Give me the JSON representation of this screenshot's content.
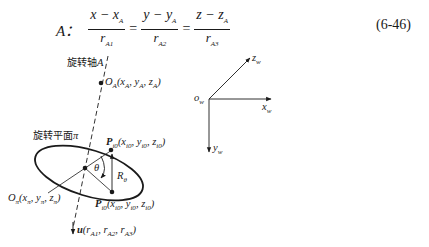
{
  "equation": {
    "label": "A：",
    "fractions": [
      {
        "numerator": "x − x",
        "num_sub": "A",
        "denominator": "r",
        "den_sub": "A1"
      },
      {
        "numerator": "y − y",
        "num_sub": "A",
        "denominator": "r",
        "den_sub": "A2"
      },
      {
        "numerator": "z − z",
        "num_sub": "A",
        "denominator": "r",
        "den_sub": "A3"
      }
    ],
    "operator": "=",
    "number": "(6-46)"
  },
  "diagram": {
    "axis_label": {
      "text": "旋转轴",
      "var": "A"
    },
    "plane_label": {
      "text": "旋转平面",
      "var": "π"
    },
    "point_OA": {
      "name": "O",
      "sub": "A",
      "coords": "(x",
      "args": [
        [
          "A"
        ],
        [
          "A"
        ],
        [
          "A"
        ]
      ]
    },
    "labels": {
      "OA": "O_A(x_A, y_A, z_A)",
      "Opi": "O_π(x_π, y_π, z_π)",
      "Pi0_top": "P_i0(x_i0, y_i0, z_i0)",
      "Pi0_bottom": "P_i0(x_i0, y_i0, z_i0)",
      "theta": "θ",
      "R": "R",
      "R_sub": "θ",
      "u": "u(r_A1, r_A2, r_A3)"
    },
    "frame": {
      "origin": "o",
      "origin_sub": "w",
      "x": "x",
      "y": "y",
      "z": "z",
      "axis_sub": "w"
    }
  }
}
